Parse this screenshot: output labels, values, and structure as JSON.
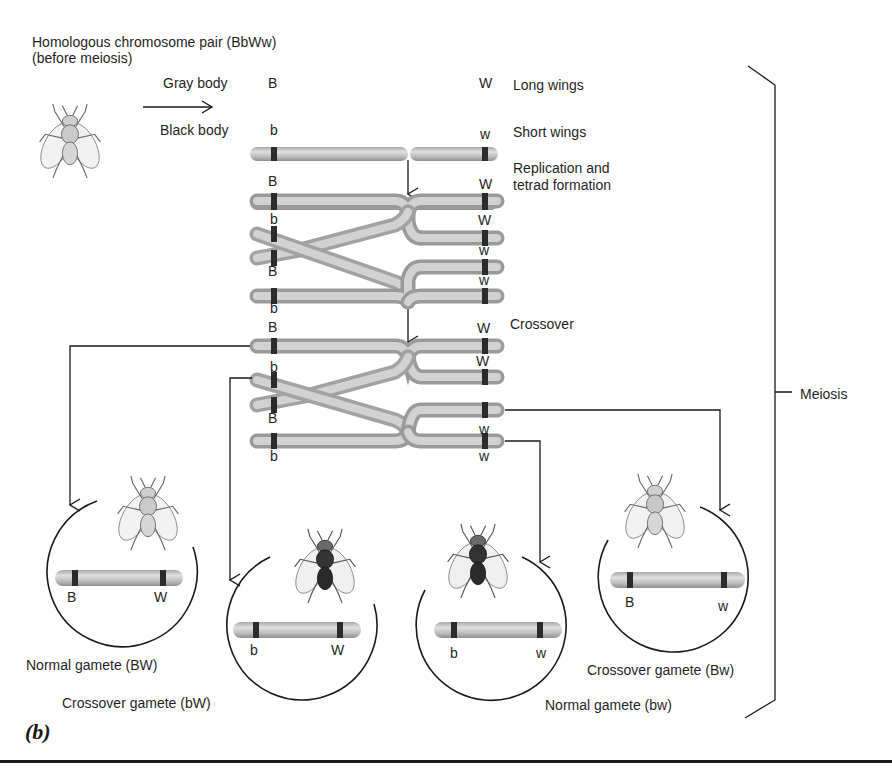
{
  "header": {
    "title_line1": "Homologous chromosome pair (BbWw)",
    "title_line2": "(before meiosis)"
  },
  "traits": {
    "gray_body": "Gray body",
    "black_body": "Black body",
    "long_wings": "Long wings",
    "short_wings": "Short wings"
  },
  "steps": {
    "replication_line1": "Replication and",
    "replication_line2": "tetrad formation",
    "crossover": "Crossover",
    "meiosis": "Meiosis"
  },
  "chromosomes": {
    "initial": [
      {
        "left_allele": "B",
        "right_allele": "W"
      },
      {
        "left_allele": "b",
        "right_allele": "w"
      }
    ],
    "tetrad": [
      {
        "left_allele": "B",
        "right_allele": "W"
      },
      {
        "left_allele": "b",
        "right_allele": "W"
      },
      {
        "left_allele": "B",
        "right_allele": "w"
      },
      {
        "left_allele": "b",
        "right_allele": "w"
      }
    ],
    "crossover": [
      {
        "left_allele": "B",
        "right_allele": "W"
      },
      {
        "left_allele": "b",
        "right_allele": "W"
      },
      {
        "left_allele": "B",
        "right_allele": "w"
      },
      {
        "left_allele": "b",
        "right_allele": "w"
      }
    ]
  },
  "gametes": [
    {
      "label": "Normal gamete (BW)",
      "left_allele": "B",
      "right_allele": "W",
      "body": "gray",
      "fill": "#d9d9d9"
    },
    {
      "label": "Crossover gamete (bW)",
      "left_allele": "b",
      "right_allele": "W",
      "body": "black",
      "fill": "#3a3a3a"
    },
    {
      "label": "Normal gamete (bw)",
      "left_allele": "b",
      "right_allele": "w",
      "body": "black",
      "fill": "#3a3a3a"
    },
    {
      "label": "Crossover gamete (Bw)",
      "left_allele": "B",
      "right_allele": "w",
      "body": "gray",
      "fill": "#d9d9d9"
    }
  ],
  "figure_label": "(b)",
  "colors": {
    "chromosome": "#b5b5b5",
    "chromosome_light": "#d8d8d8",
    "band": "#2b2b2b",
    "line": "#1a1a1a"
  }
}
